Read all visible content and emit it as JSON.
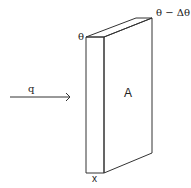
{
  "diagram": {
    "type": "heat conduction through a slab",
    "labels": {
      "heat_flow": "q",
      "area": "A",
      "thickness": "x",
      "temperature_hot": "θ",
      "temperature_cold": "θ − Δθ"
    },
    "colors": {
      "stroke": "#333333",
      "background": "#ffffff"
    }
  }
}
